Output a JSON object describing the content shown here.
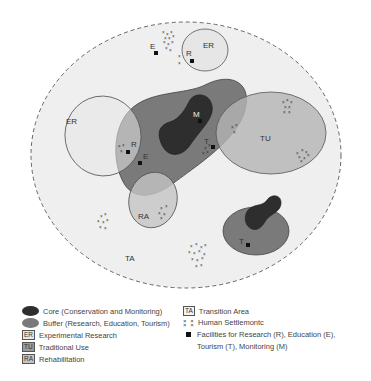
{
  "diagram": {
    "colors": {
      "transition": "#efefef",
      "buffer": "#7a7a7a",
      "core": "#2e2e2e",
      "experimental": "#e6e6e6",
      "traditional_use": "#b4b4b4",
      "rehabilitation": "#c4c4c4",
      "facility": "#111111"
    },
    "zone_labels": {
      "er_top": "ER",
      "er_left": "ER",
      "tu": "TU",
      "ra": "RA",
      "ta": "TA"
    },
    "facilities": [
      {
        "label": "E",
        "zone": "transition-top"
      },
      {
        "label": "R",
        "zone": "experimental-top"
      },
      {
        "label": "M",
        "zone": "core-main"
      },
      {
        "label": "T",
        "zone": "buffer-main"
      },
      {
        "label": "R",
        "zone": "experimental-left"
      },
      {
        "label": "E",
        "zone": "buffer-main"
      },
      {
        "label": "T",
        "zone": "buffer-small"
      }
    ]
  },
  "legend": {
    "core": "Core (Conservation and Monitoring)",
    "buffer": "Buffer (Research, Education, Tourism)",
    "er_abbr": "ER",
    "er": "Experimental Research",
    "tu_abbr": "TU",
    "tu": "Traditional Use",
    "ra_abbr": "RA",
    "ra": "Rehabilitation",
    "ta_abbr": "TA",
    "ta": "Transition Area",
    "settlement_glyph": "x x x x",
    "settlement": "Human Settlemontc",
    "facilities_line1": "Facilities for Research (R), Education (E),",
    "facilities_line2": "Tourism (T), Monitoring (M)"
  }
}
